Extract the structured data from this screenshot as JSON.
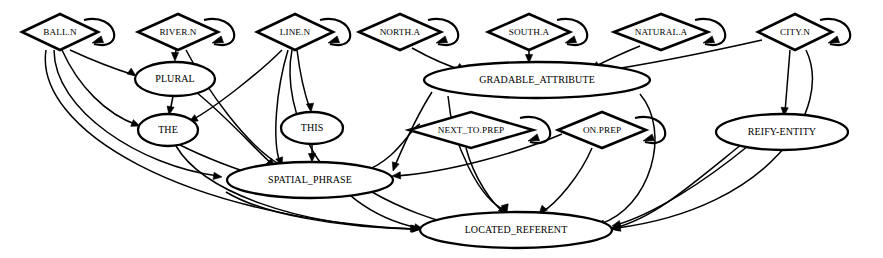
{
  "diagram": {
    "background_color": "#ffffff",
    "stroke_color": "#000000",
    "node_shapes": {
      "lexical_entry": "diamond",
      "construction": "ellipse"
    },
    "nodes": [
      {
        "id": "ball_n",
        "label": "BALL.N",
        "shape": "diamond",
        "cx": 60,
        "cy": 32,
        "rx": 38,
        "ry": 18,
        "font": "tiny",
        "self_loop": true
      },
      {
        "id": "river_n",
        "label": "RIVER.N",
        "shape": "diamond",
        "cx": 178,
        "cy": 32,
        "rx": 40,
        "ry": 18,
        "font": "tiny",
        "self_loop": true
      },
      {
        "id": "line_n",
        "label": "LINE.N",
        "shape": "diamond",
        "cx": 295,
        "cy": 32,
        "rx": 38,
        "ry": 18,
        "font": "tiny",
        "self_loop": true
      },
      {
        "id": "north_a",
        "label": "NORTH.A",
        "shape": "diamond",
        "cx": 400,
        "cy": 32,
        "rx": 41,
        "ry": 18,
        "font": "tiny",
        "self_loop": true
      },
      {
        "id": "south_a",
        "label": "SOUTH.A",
        "shape": "diamond",
        "cx": 529,
        "cy": 32,
        "rx": 41,
        "ry": 18,
        "font": "tiny",
        "self_loop": true
      },
      {
        "id": "natural_a",
        "label": "NATURAL.A",
        "shape": "diamond",
        "cx": 661,
        "cy": 32,
        "rx": 47,
        "ry": 18,
        "font": "tiny",
        "self_loop": true
      },
      {
        "id": "city_n",
        "label": "CITY.N",
        "shape": "diamond",
        "cx": 795,
        "cy": 32,
        "rx": 37,
        "ry": 18,
        "font": "tiny",
        "self_loop": true
      },
      {
        "id": "plural",
        "label": "PLURAL",
        "shape": "ellipse",
        "cx": 175,
        "cy": 79,
        "rx": 40,
        "ry": 17,
        "font": "small",
        "self_loop": false
      },
      {
        "id": "gradable_attribute",
        "label": "GRADABLE_ATTRIBUTE",
        "shape": "ellipse",
        "cx": 537,
        "cy": 80,
        "rx": 113,
        "ry": 18,
        "font": "small",
        "self_loop": false
      },
      {
        "id": "the",
        "label": "THE",
        "shape": "ellipse",
        "cx": 168,
        "cy": 130,
        "rx": 30,
        "ry": 16,
        "font": "small",
        "self_loop": false
      },
      {
        "id": "this",
        "label": "THIS",
        "shape": "ellipse",
        "cx": 312,
        "cy": 128,
        "rx": 31,
        "ry": 16,
        "font": "small",
        "self_loop": false
      },
      {
        "id": "next_to_prep",
        "label": "NEXT_TO.PREP",
        "shape": "diamond",
        "cx": 471,
        "cy": 130,
        "rx": 62,
        "ry": 18,
        "font": "tiny",
        "self_loop": true
      },
      {
        "id": "on_prep",
        "label": "ON.PREP",
        "shape": "diamond",
        "cx": 602,
        "cy": 130,
        "rx": 44,
        "ry": 18,
        "font": "tiny",
        "self_loop": true
      },
      {
        "id": "reify_entity",
        "label": "REIFY-ENTITY",
        "shape": "ellipse",
        "cx": 782,
        "cy": 132,
        "rx": 66,
        "ry": 18,
        "font": "small",
        "self_loop": false
      },
      {
        "id": "spatial_phrase",
        "label": "SPATIAL_PHRASE",
        "shape": "ellipse",
        "cx": 310,
        "cy": 180,
        "rx": 83,
        "ry": 18,
        "font": "small",
        "self_loop": false
      },
      {
        "id": "located_referent",
        "label": "LOCATED_REFERENT",
        "shape": "ellipse",
        "cx": 516,
        "cy": 230,
        "rx": 96,
        "ry": 18,
        "font": "small",
        "self_loop": false
      }
    ],
    "edges": [
      {
        "from": "ball_n",
        "to": "plural",
        "path": "M 70,50 C 96,62 118,70 134,75",
        "arrow": [
          136,
          76,
          0.62
        ]
      },
      {
        "from": "ball_n",
        "to": "the",
        "path": "M 62,50 C 78,86 106,114 137,125",
        "arrow": [
          140,
          126,
          0.36
        ]
      },
      {
        "from": "ball_n",
        "to": "spatial_phrase",
        "path": "M 54,50 C 54,110 140,166 218,176",
        "arrow": [
          222,
          177,
          0.13
        ]
      },
      {
        "from": "ball_n",
        "to": "located_referent",
        "path": "M 46,50 C 34,128 180,218 416,229",
        "arrow": [
          421,
          229,
          0.03
        ]
      },
      {
        "from": "river_n",
        "to": "plural",
        "path": "M 176,50 L 175,58",
        "arrow": [
          175,
          61,
          1.57
        ]
      },
      {
        "from": "river_n",
        "to": "spatial_phrase",
        "path": "M 186,50 C 206,88 246,146 282,166",
        "arrow": [
          286,
          168,
          0.5
        ]
      },
      {
        "from": "line_n",
        "to": "the",
        "path": "M 282,50 C 258,74 214,108 192,120",
        "arrow": [
          189,
          122,
          2.63
        ]
      },
      {
        "from": "line_n",
        "to": "this",
        "path": "M 297,50 C 300,74 306,98 310,109",
        "arrow": [
          311,
          112,
          1.45
        ]
      },
      {
        "from": "line_n",
        "to": "spatial_phrase",
        "path": "M 288,50 C 276,90 272,140 280,163",
        "arrow": [
          282,
          166,
          1.24
        ]
      },
      {
        "from": "line_n",
        "to": "located_referent",
        "path": "M 292,50 C 280,110 322,208 418,228",
        "arrow": [
          423,
          229,
          0.2
        ]
      },
      {
        "from": "north_a",
        "to": "gradable_attribute",
        "path": "M 412,48 C 430,58 448,66 462,70",
        "arrow": [
          465,
          71,
          0.56
        ]
      },
      {
        "from": "south_a",
        "to": "gradable_attribute",
        "path": "M 529,50 L 529,60",
        "arrow": [
          529,
          63,
          1.57
        ]
      },
      {
        "from": "natural_a",
        "to": "gradable_attribute",
        "path": "M 640,46 C 620,54 604,62 594,67",
        "arrow": [
          591,
          69,
          2.62
        ]
      },
      {
        "from": "city_n",
        "to": "gradable_attribute",
        "path": "M 762,40 C 700,54 636,66 596,72",
        "arrow": [
          592,
          73,
          2.99
        ]
      },
      {
        "from": "city_n",
        "to": "reify_entity",
        "path": "M 790,50 L 785,112",
        "arrow": [
          784,
          116,
          1.65
        ]
      },
      {
        "from": "city_n",
        "to": "located_referent",
        "path": "M 806,50 C 834,108 770,208 617,228",
        "arrow": [
          612,
          229,
          3.0
        ]
      },
      {
        "from": "plural",
        "to": "the",
        "path": "M 173,96 L 170,112",
        "arrow": [
          169,
          115,
          1.76
        ]
      },
      {
        "from": "plural",
        "to": "spatial_phrase",
        "path": "M 196,92 C 228,118 256,150 272,164",
        "arrow": [
          275,
          167,
          0.75
        ]
      },
      {
        "from": "gradable_attribute",
        "to": "spatial_phrase",
        "path": "M 432,92 C 414,120 400,154 394,168",
        "arrow": [
          393,
          171,
          1.9
        ]
      },
      {
        "from": "gradable_attribute",
        "to": "located_referent",
        "path": "M 448,96 C 452,144 480,200 505,210",
        "arrow": [
          507,
          213,
          1.3
        ]
      },
      {
        "from": "gradable_attribute",
        "to": "located_referent",
        "path": "M 640,94 C 672,132 650,208 600,224",
        "arrow": [
          596,
          226,
          2.85
        ]
      },
      {
        "from": "the",
        "to": "spatial_phrase",
        "path": "M 180,145 C 206,158 238,170 256,175",
        "arrow": [
          259,
          176,
          0.36
        ]
      },
      {
        "from": "the",
        "to": "located_referent",
        "path": "M 176,146 C 202,190 292,226 414,229",
        "arrow": [
          419,
          229,
          0.06
        ]
      },
      {
        "from": "this",
        "to": "spatial_phrase",
        "path": "M 312,144 L 312,159",
        "arrow": [
          312,
          162,
          1.57
        ]
      },
      {
        "from": "next_to_prep",
        "to": "spatial_phrase",
        "path": "M 420,124 C 410,128 398,160 362,172",
        "arrow": [
          358,
          173,
          2.93
        ]
      },
      {
        "from": "next_to_prep",
        "to": "located_referent",
        "path": "M 466,148 C 474,178 492,204 504,212",
        "arrow": [
          507,
          214,
          0.75
        ]
      },
      {
        "from": "on_prep",
        "to": "spatial_phrase",
        "path": "M 562,134 C 520,152 450,172 396,176",
        "arrow": [
          392,
          176,
          3.07
        ]
      },
      {
        "from": "on_prep",
        "to": "located_referent",
        "path": "M 592,148 C 580,176 556,204 542,212",
        "arrow": [
          539,
          214,
          2.3
        ]
      },
      {
        "from": "reify_entity",
        "to": "located_referent",
        "path": "M 748,146 C 704,182 654,214 616,225",
        "arrow": [
          612,
          226,
          2.9
        ]
      },
      {
        "from": "reify_entity",
        "to": "located_referent",
        "path": "M 742,144 C 690,186 654,218 614,228",
        "arrow": [
          610,
          229,
          2.95
        ]
      },
      {
        "from": "spatial_phrase",
        "to": "located_referent",
        "path": "M 372,192 C 400,208 436,222 466,227",
        "arrow": [
          470,
          228,
          0.25
        ]
      },
      {
        "from": "spatial_phrase",
        "to": "located_referent",
        "path": "M 226,192 C 262,214 340,228 415,229",
        "arrow": [
          420,
          229,
          0.04
        ]
      }
    ],
    "self_loops": [
      {
        "node": "ball_n",
        "path": "M 84,20 C 118,12 126,52 94,44",
        "arrow": [
          92,
          43,
          2.8
        ]
      },
      {
        "node": "river_n",
        "path": "M 204,20 C 238,12 246,52 214,44",
        "arrow": [
          212,
          43,
          2.8
        ]
      },
      {
        "node": "line_n",
        "path": "M 320,20 C 354,12 362,52 330,44",
        "arrow": [
          328,
          43,
          2.8
        ]
      },
      {
        "node": "north_a",
        "path": "M 428,20 C 462,12 470,52 438,44",
        "arrow": [
          436,
          43,
          2.8
        ]
      },
      {
        "node": "south_a",
        "path": "M 557,20 C 591,12 599,52 567,44",
        "arrow": [
          565,
          43,
          2.8
        ]
      },
      {
        "node": "natural_a",
        "path": "M 695,20 C 729,12 737,52 705,44",
        "arrow": [
          703,
          43,
          2.8
        ]
      },
      {
        "node": "city_n",
        "path": "M 820,20 C 854,12 862,52 830,44",
        "arrow": [
          828,
          43,
          2.8
        ]
      },
      {
        "node": "next_to_prep",
        "path": "M 520,118 C 554,110 562,150 530,142",
        "arrow": [
          528,
          141,
          2.8
        ]
      },
      {
        "node": "on_prep",
        "path": "M 635,118 C 669,110 677,150 645,142",
        "arrow": [
          643,
          141,
          2.8
        ]
      }
    ]
  }
}
